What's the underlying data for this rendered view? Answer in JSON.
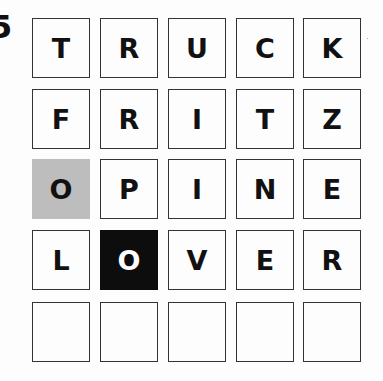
{
  "puzzle": {
    "number_partial": "5"
  },
  "layout": {
    "col_x": [
      0,
      68,
      136,
      204,
      271
    ],
    "row_y": [
      0,
      71,
      141,
      212,
      284
    ]
  },
  "colors": {
    "present": "#bdbdbd",
    "correct": "#0d0d0d",
    "empty": "#fdfdfd",
    "border": "#333333"
  },
  "grid": {
    "rows": [
      {
        "word": "TRUCK",
        "tiles": [
          {
            "letter": "T",
            "state": "empty"
          },
          {
            "letter": "R",
            "state": "empty"
          },
          {
            "letter": "U",
            "state": "empty"
          },
          {
            "letter": "C",
            "state": "empty"
          },
          {
            "letter": "K",
            "state": "empty"
          }
        ]
      },
      {
        "word": "FRITZ",
        "tiles": [
          {
            "letter": "F",
            "state": "empty"
          },
          {
            "letter": "R",
            "state": "empty"
          },
          {
            "letter": "I",
            "state": "empty"
          },
          {
            "letter": "T",
            "state": "empty"
          },
          {
            "letter": "Z",
            "state": "empty"
          }
        ]
      },
      {
        "word": "OPINE",
        "tiles": [
          {
            "letter": "O",
            "state": "present"
          },
          {
            "letter": "P",
            "state": "empty"
          },
          {
            "letter": "I",
            "state": "empty"
          },
          {
            "letter": "N",
            "state": "empty"
          },
          {
            "letter": "E",
            "state": "empty"
          }
        ]
      },
      {
        "word": "LOVER",
        "tiles": [
          {
            "letter": "L",
            "state": "empty"
          },
          {
            "letter": "O",
            "state": "correct"
          },
          {
            "letter": "V",
            "state": "empty"
          },
          {
            "letter": "E",
            "state": "empty"
          },
          {
            "letter": "R",
            "state": "empty"
          }
        ]
      },
      {
        "word": "",
        "tiles": [
          {
            "letter": "",
            "state": "empty"
          },
          {
            "letter": "",
            "state": "empty"
          },
          {
            "letter": "",
            "state": "empty"
          },
          {
            "letter": "",
            "state": "empty"
          },
          {
            "letter": "",
            "state": "empty"
          }
        ]
      }
    ]
  }
}
